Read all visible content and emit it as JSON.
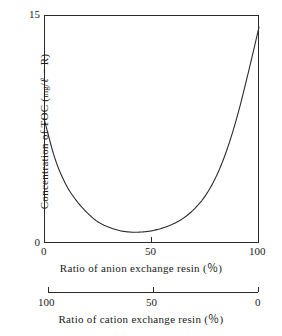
{
  "chart_data": {
    "type": "line",
    "title": "",
    "subtitle": "",
    "ylabel_parts": {
      "lead": "Concentration of  TOC ",
      "open_paren": "(",
      "unit_mg": "mg",
      "slash": "/",
      "unit_l": "ℓ",
      "dash": " − ",
      "unit_r": "R",
      "close_paren": ")"
    },
    "ylabel": "Concentration of TOC (mg/ℓ − R)",
    "ylim": [
      0,
      15
    ],
    "yticks": [
      0,
      15
    ],
    "ytick_labels": [
      "0",
      "15"
    ],
    "grid": false,
    "legend": "none",
    "axes": [
      {
        "id": "anion",
        "position": "bottom-primary",
        "xlabel": "Ratio of  anion exchange  resin  (％)",
        "xlim": [
          0,
          100
        ],
        "xticks": [
          0,
          50,
          100
        ],
        "xtick_labels": [
          "0",
          "50",
          "100"
        ],
        "reversed": false
      },
      {
        "id": "cation",
        "position": "bottom-secondary",
        "xlabel": "Ratio of  cation exchange  resin  (％)",
        "xlim": [
          100,
          0
        ],
        "xticks": [
          100,
          50,
          0
        ],
        "xtick_labels": [
          "100",
          "50",
          "0"
        ],
        "reversed": true
      }
    ],
    "series": [
      {
        "name": "TOC concentration",
        "color": "#2b2b2b",
        "x": [
          0,
          5,
          10,
          15,
          20,
          25,
          30,
          35,
          40,
          45,
          50,
          55,
          60,
          65,
          70,
          75,
          80,
          85,
          90,
          95,
          100
        ],
        "y": [
          8.2,
          5.6,
          3.9,
          2.8,
          2.0,
          1.4,
          1.05,
          0.82,
          0.72,
          0.72,
          0.8,
          0.98,
          1.25,
          1.65,
          2.25,
          3.1,
          4.35,
          6.1,
          8.4,
          11.2,
          14.2
        ]
      }
    ],
    "annotations": []
  },
  "figure": {
    "background": "#ffffff",
    "axis_color": "#2b2b2b",
    "curve_color": "#2b2b2b"
  }
}
